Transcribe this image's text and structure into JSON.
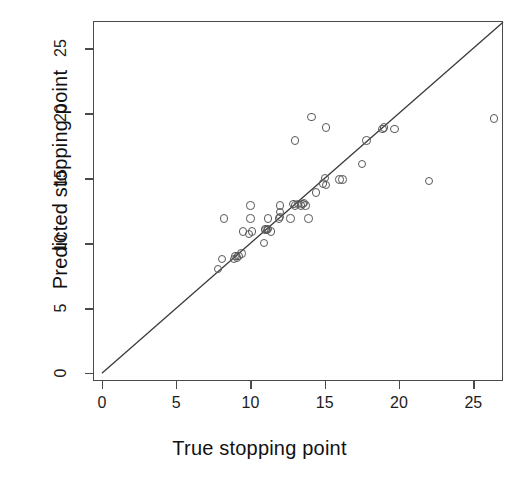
{
  "chart_data": {
    "type": "scatter",
    "title": "",
    "xlabel": "True stopping point",
    "ylabel": "Predicted stopping point",
    "xlim": [
      -0.6,
      27.0
    ],
    "ylim": [
      -0.6,
      27.1
    ],
    "xticks": [
      0,
      5,
      10,
      15,
      20,
      25
    ],
    "yticks": [
      0,
      5,
      10,
      15,
      20,
      25
    ],
    "xtick_labels": [
      "0",
      "5",
      "10",
      "15",
      "20",
      "25"
    ],
    "ytick_labels": [
      "0",
      "5",
      "10",
      "15",
      "20",
      "25"
    ],
    "grid": false,
    "legend": null,
    "marker": "open-circle",
    "marker_color": "#585858",
    "line_color": "#3a3a3a",
    "reference_line": {
      "label": "identity line y = x",
      "slope": 1,
      "intercept": 0,
      "x_start": 0,
      "x_end": 27
    },
    "series": [
      {
        "name": "Predicted vs true stopping point",
        "points": [
          [
            7.8,
            8.0
          ],
          [
            8.1,
            8.8
          ],
          [
            8.2,
            11.9
          ],
          [
            8.9,
            8.8
          ],
          [
            9.0,
            9.0
          ],
          [
            9.1,
            8.9
          ],
          [
            9.2,
            9.0
          ],
          [
            9.4,
            9.2
          ],
          [
            9.5,
            10.9
          ],
          [
            9.9,
            10.7
          ],
          [
            10.0,
            11.9
          ],
          [
            10.0,
            12.9
          ],
          [
            10.1,
            10.9
          ],
          [
            10.9,
            10.0
          ],
          [
            11.0,
            11.0
          ],
          [
            11.0,
            11.1
          ],
          [
            11.1,
            11.0
          ],
          [
            11.2,
            11.1
          ],
          [
            11.2,
            11.9
          ],
          [
            11.4,
            10.9
          ],
          [
            11.9,
            11.9
          ],
          [
            12.0,
            12.0
          ],
          [
            12.0,
            12.4
          ],
          [
            12.0,
            12.9
          ],
          [
            12.7,
            11.9
          ],
          [
            12.9,
            13.0
          ],
          [
            13.0,
            12.9
          ],
          [
            13.0,
            17.9
          ],
          [
            13.2,
            13.0
          ],
          [
            13.4,
            12.9
          ],
          [
            13.5,
            13.0
          ],
          [
            13.6,
            13.1
          ],
          [
            13.7,
            12.9
          ],
          [
            13.9,
            11.9
          ],
          [
            14.1,
            19.7
          ],
          [
            14.4,
            13.9
          ],
          [
            14.9,
            14.6
          ],
          [
            15.0,
            15.0
          ],
          [
            15.1,
            14.5
          ],
          [
            15.1,
            18.9
          ],
          [
            16.0,
            14.9
          ],
          [
            16.2,
            14.9
          ],
          [
            17.5,
            16.1
          ],
          [
            17.8,
            17.9
          ],
          [
            18.9,
            18.8
          ],
          [
            19.0,
            18.9
          ],
          [
            19.7,
            18.8
          ],
          [
            22.0,
            14.8
          ],
          [
            26.4,
            19.6
          ]
        ]
      }
    ]
  }
}
